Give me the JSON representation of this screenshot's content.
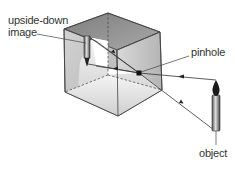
{
  "labels": {
    "image_line1": "upside-down",
    "image_line2": "image",
    "pinhole": "pinhole",
    "object": "object"
  },
  "colors": {
    "outline": "#444444",
    "front_face": "#c8c8c8",
    "right_face": "#bdbdbd",
    "back_face": "#8c8c8c",
    "floor": "#e4e4e4",
    "interior": "#ffffff",
    "text": "#333333"
  }
}
